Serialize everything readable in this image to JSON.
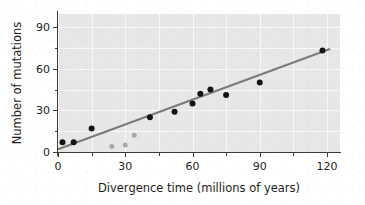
{
  "chart_data": {
    "type": "scatter",
    "title": "",
    "xlabel": "Divergence time (millions of years)",
    "ylabel": "Number of mutations",
    "xlim": [
      0,
      126
    ],
    "ylim": [
      0,
      96
    ],
    "xticks": [
      0,
      30,
      60,
      90,
      120
    ],
    "yticks": [
      0,
      30,
      60,
      90
    ],
    "xtick_labels": [
      "0",
      "30",
      "60",
      "90",
      "120"
    ],
    "ytick_labels": [
      "0",
      "30",
      "60",
      "90"
    ],
    "minor_xticks": [
      15,
      45,
      75,
      105
    ],
    "minor_yticks": [
      15,
      45,
      75
    ],
    "grid": true,
    "legend": "none",
    "plot_background": "#e7e7e7",
    "grid_color": "#f7f7f7",
    "axis_color": "#3b3b3b",
    "series": [
      {
        "name": "primary-samples",
        "marker": "filled-circle",
        "color": "#141414",
        "marker_size": 6,
        "points": [
          {
            "x": 2,
            "y": 7
          },
          {
            "x": 7,
            "y": 7
          },
          {
            "x": 15,
            "y": 17
          },
          {
            "x": 41,
            "y": 25
          },
          {
            "x": 52,
            "y": 29
          },
          {
            "x": 60,
            "y": 35
          },
          {
            "x": 63.5,
            "y": 42
          },
          {
            "x": 68,
            "y": 45
          },
          {
            "x": 75,
            "y": 41
          },
          {
            "x": 90,
            "y": 50
          },
          {
            "x": 118,
            "y": 73
          }
        ]
      },
      {
        "name": "outlier-samples",
        "marker": "filled-circle",
        "color": "#a8a8a8",
        "marker_size": 5,
        "points": [
          {
            "x": 24,
            "y": 4
          },
          {
            "x": 30,
            "y": 5
          },
          {
            "x": 34,
            "y": 12
          }
        ]
      }
    ],
    "trendline": {
      "name": "best-fit-line",
      "color": "#7b7b7b",
      "width": 2.2,
      "x_start": 0,
      "y_start": 2,
      "x_end": 121,
      "y_end": 74,
      "slope": 0.595,
      "intercept": 2
    }
  },
  "axis": {
    "x_label": "Divergence time (millions of years)",
    "y_label": "Number of mutations"
  }
}
